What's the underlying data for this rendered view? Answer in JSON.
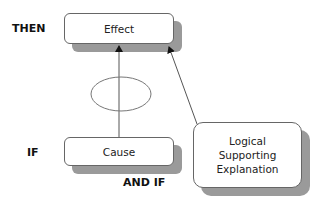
{
  "labels": {
    "then": "THEN",
    "if": "IF",
    "and_if": "AND IF"
  },
  "nodes": {
    "effect": "Effect",
    "cause": "Cause",
    "explanation": [
      "Logical",
      "Supporting",
      "Explanation"
    ]
  },
  "colors": {
    "shadow": "#9a9a9a",
    "border": "#666666",
    "line": "#555555"
  }
}
